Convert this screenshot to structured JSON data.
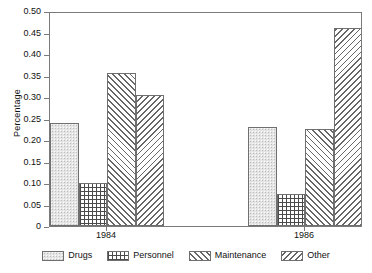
{
  "chart_data": {
    "type": "bar",
    "title": "",
    "xlabel": "",
    "ylabel": "Percentage",
    "categories": [
      "1984",
      "1986"
    ],
    "series": [
      {
        "name": "Drugs",
        "pattern": "light-stipple",
        "values": [
          0.24,
          0.23
        ]
      },
      {
        "name": "Personnel",
        "pattern": "checkerboard-dots",
        "values": [
          0.1,
          0.075
        ]
      },
      {
        "name": "Maintenance",
        "pattern": "forward-diagonal",
        "values": [
          0.355,
          0.225
        ]
      },
      {
        "name": "Other",
        "pattern": "backward-diagonal",
        "values": [
          0.305,
          0.46
        ]
      }
    ],
    "ylim": [
      0,
      0.5
    ],
    "yticks": [
      "0",
      "0.05",
      "0.10",
      "0.15",
      "0.20",
      "0.25",
      "0.30",
      "0.35",
      "0.40",
      "0.45",
      "0.50"
    ],
    "ytick_values": [
      0,
      0.05,
      0.1,
      0.15,
      0.2,
      0.25,
      0.3,
      0.35,
      0.4,
      0.45,
      0.5
    ],
    "grid": false,
    "legend_position": "bottom",
    "frame_color": "#7a7a7a",
    "bar_edge_color": "#6f6f6f"
  }
}
